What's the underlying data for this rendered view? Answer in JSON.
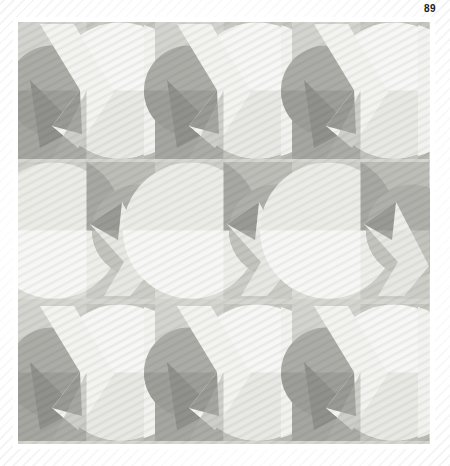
{
  "page": {
    "folio": "89",
    "background": "#ffffff",
    "stripe_color": "#e2e2e2"
  },
  "plate": {
    "label": "geometric-pattern-plate",
    "x": 18,
    "y": 22,
    "width": 412,
    "height": 422,
    "frame_color": "#ffffff"
  },
  "palette": {
    "lightest": "#f4f4f2",
    "light": "#e9e9e5",
    "pale": "#dcdcd6",
    "mid_light": "#c8c8c2",
    "mid": "#b4b4ae",
    "mid_dark": "#9d9d98",
    "dark": "#8d8d88",
    "darkest": "#7e7e79"
  },
  "artwork": {
    "title": "Repeating geometric grid",
    "grid_columns": 3,
    "grid_rows": 3,
    "motif_size": 137,
    "motif_elements": [
      "circle",
      "quarter-circle",
      "triangle",
      "chevron-ribbon",
      "checker-quadrant"
    ],
    "texture": "diagonal-hatch",
    "row_variants": [
      "A",
      "B",
      "A"
    ],
    "description": "Three by three grid of grayscale geometric motifs combining large circles, chevron ribbons and triangles over checkerboard tinted quadrants with fine diagonal hatching."
  }
}
